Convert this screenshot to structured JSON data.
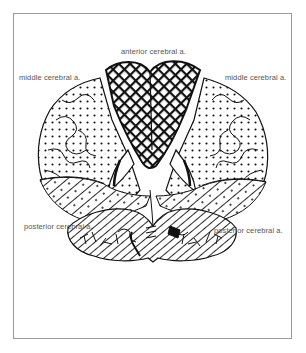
{
  "figure": {
    "type": "coronal brain section - arterial territories",
    "labels": {
      "anterior": "anterior cerebral a.",
      "middle_left": "middle cerebral a.",
      "middle_right": "middle cerebral a.",
      "posterior_left": "posterior cerebral a.",
      "posterior_right": "posterior cerebral a."
    },
    "legend_patterns": {
      "anterior_cerebral": "crosshatch",
      "middle_cerebral": "dots",
      "posterior_cerebral": "diagonal lines"
    },
    "colors": {
      "ink": "#111111",
      "label_text": "#555555",
      "frame": "#9a9a9a",
      "background": "#ffffff"
    }
  }
}
